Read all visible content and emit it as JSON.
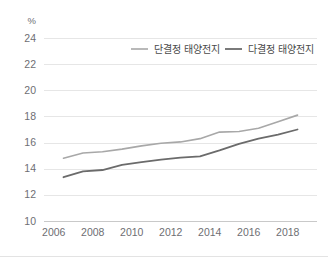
{
  "chart_data": {
    "type": "line",
    "title": "",
    "unit_label": "%",
    "xlabel": "",
    "ylabel": "",
    "xlim": [
      2005.5,
      2019.5
    ],
    "ylim": [
      10,
      24
    ],
    "yticks": [
      10,
      12,
      14,
      16,
      18,
      20,
      22,
      24
    ],
    "xticks": [
      2006,
      2008,
      2010,
      2012,
      2014,
      2016,
      2018
    ],
    "grid": true,
    "legend_position": "top-center",
    "x": [
      2006.5,
      2007.5,
      2008.5,
      2009.5,
      2010.5,
      2011.5,
      2012.5,
      2013.5,
      2014.5,
      2015.5,
      2016.5,
      2017.5,
      2018.5
    ],
    "series": [
      {
        "name": "단결정 태양전지",
        "color": "#a8a8a8",
        "width": 1.6,
        "values": [
          14.8,
          15.2,
          15.3,
          15.5,
          15.75,
          15.95,
          16.05,
          16.3,
          16.8,
          16.85,
          17.1,
          17.6,
          18.1
        ]
      },
      {
        "name": "다결정 태양전지",
        "color": "#6b6b6b",
        "width": 1.8,
        "values": [
          13.35,
          13.8,
          13.9,
          14.3,
          14.5,
          14.7,
          14.85,
          14.95,
          15.4,
          15.9,
          16.3,
          16.6,
          17.0
        ]
      }
    ]
  },
  "legend": {
    "items": [
      {
        "label": "단결정 태양전지",
        "color": "#a8a8a8"
      },
      {
        "label": "다결정 태양전지",
        "color": "#6b6b6b"
      }
    ]
  }
}
